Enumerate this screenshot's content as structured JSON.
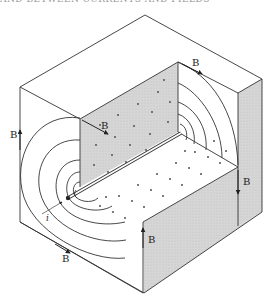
{
  "caption": {
    "text": "AND BETWEEN CURRENTS AND FIELDS"
  },
  "figure": {
    "labels": {
      "b_left": "B",
      "b_wall": "B",
      "b_top_right": "B",
      "b_right": "B",
      "b_front": "B",
      "b_bottom": "B",
      "current": "i"
    },
    "colors": {
      "line": "#333333",
      "shade": "#d4d4d4",
      "background": "#ffffff",
      "dot": "#444444"
    }
  }
}
